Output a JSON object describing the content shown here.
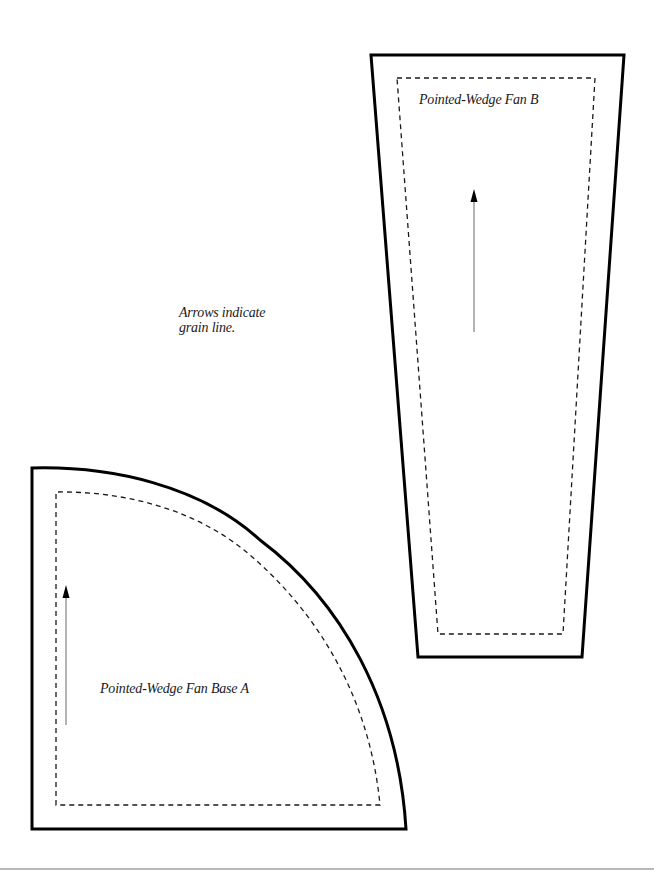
{
  "pieces": {
    "fan_b": {
      "label": "Pointed-Wedge Fan B",
      "shape": "trapezoid",
      "cut_line": "solid",
      "seam_line": "dashed"
    },
    "fan_base_a": {
      "label": "Pointed-Wedge Fan Base A",
      "shape": "quarter-circle",
      "cut_line": "solid",
      "seam_line": "dashed"
    }
  },
  "note": {
    "line1": "Arrows indicate",
    "line2": "grain line."
  },
  "icons": {
    "grain_arrow_b": "arrow-up-icon",
    "grain_arrow_a": "arrow-up-icon"
  },
  "colors": {
    "outline": "#000000",
    "seam": "#1a1a1a",
    "arrow": "#808080",
    "rule": "#b9b9b9",
    "background": "#ffffff"
  }
}
